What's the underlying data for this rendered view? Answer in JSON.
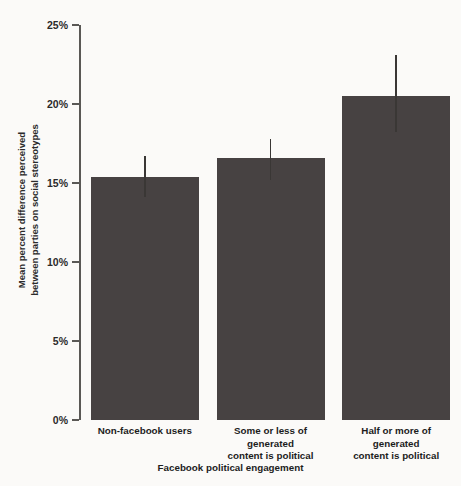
{
  "chart_data": {
    "type": "bar",
    "title": "",
    "xlabel": "Facebook political engagement",
    "ylabel_line1": "Mean percent difference perceived",
    "ylabel_line2": "between parties on social stereotypes",
    "categories": [
      "Non-facebook users",
      "Some or less of generated content is political",
      "Half or more of generated content is political"
    ],
    "category_lines": [
      [
        "Non-facebook users"
      ],
      [
        "Some or less of",
        "generated",
        "content is political"
      ],
      [
        "Half or more of",
        "generated",
        "content is political"
      ]
    ],
    "values": [
      15.4,
      16.6,
      20.5
    ],
    "error_low": [
      14.1,
      15.2,
      18.2
    ],
    "error_high": [
      16.7,
      17.8,
      23.1
    ],
    "ylim": [
      0,
      25
    ],
    "ytick_values": [
      0,
      5,
      10,
      15,
      20,
      25
    ],
    "ytick_labels": [
      "0%",
      "5%",
      "10%",
      "15%",
      "20%",
      "25%"
    ],
    "grid": false,
    "legend": "none",
    "bar_color": "#474242",
    "error_color": "#3a3735",
    "axis_color": "#5a5855",
    "background_color": "#fbfaf8",
    "text_color": "#1d1d1d"
  }
}
